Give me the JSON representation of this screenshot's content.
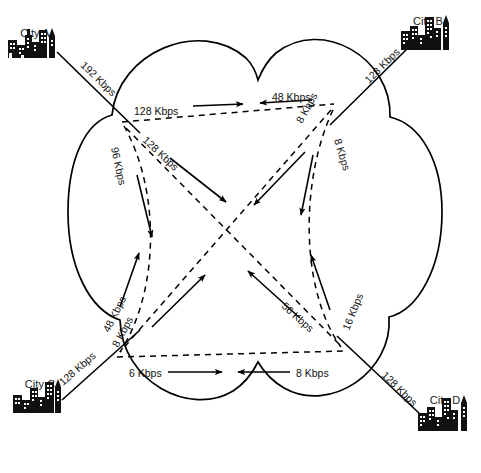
{
  "diagram": {
    "cloud_label": "wan-cloud",
    "line_color": "#000000"
  },
  "cities": [
    {
      "id": "city-a",
      "label": "City A",
      "position": "top-left",
      "access_link": "192 Kbps"
    },
    {
      "id": "city-b",
      "label": "City B",
      "position": "top-right",
      "access_link": "128 Kbps"
    },
    {
      "id": "city-c",
      "label": "City C",
      "position": "bottom-left",
      "access_link": "128 Kbps"
    },
    {
      "id": "city-d",
      "label": "City D",
      "position": "bottom-right",
      "access_link": "128 Kbps"
    }
  ],
  "access_links": [
    {
      "id": "access-a",
      "city": "City A",
      "rate": "192 Kbps"
    },
    {
      "id": "access-b",
      "city": "City B",
      "rate": "128 Kbps"
    },
    {
      "id": "access-c",
      "city": "City C",
      "rate": "128 Kbps"
    },
    {
      "id": "access-d",
      "city": "City D",
      "rate": "128 Kbps"
    }
  ],
  "pvc_links": [
    {
      "id": "pvc-top-ab",
      "from": "A",
      "to": "B",
      "rate": "128 Kbps",
      "direction": "right"
    },
    {
      "id": "pvc-top-ba",
      "from": "B",
      "to": "A",
      "rate": "48 Kbps",
      "direction": "left"
    },
    {
      "id": "pvc-left-ac",
      "from": "A",
      "to": "C",
      "rate": "96 Kbps",
      "direction": "down"
    },
    {
      "id": "pvc-left-ca",
      "from": "C",
      "to": "A",
      "rate": "48 Kbps",
      "direction": "up"
    },
    {
      "id": "pvc-diag-ad",
      "from": "A",
      "to": "D",
      "rate": "128 Kbps",
      "direction": "down-right"
    },
    {
      "id": "pvc-diag-da",
      "from": "D",
      "to": "A",
      "rate": "56 Kbps",
      "direction": "up-left"
    },
    {
      "id": "pvc-diag-bc",
      "from": "B",
      "to": "C",
      "rate": "8 Kbps",
      "direction": "down-left"
    },
    {
      "id": "pvc-diag-cb",
      "from": "C",
      "to": "B",
      "rate": "8 Kbps",
      "direction": "up-right"
    },
    {
      "id": "pvc-right-bd",
      "from": "B",
      "to": "D",
      "rate": "8 Kbps",
      "direction": "down"
    },
    {
      "id": "pvc-right-db",
      "from": "D",
      "to": "B",
      "rate": "16 Kbps",
      "direction": "up"
    },
    {
      "id": "pvc-bottom-cd",
      "from": "C",
      "to": "D",
      "rate": "6 Kbps",
      "direction": "right"
    },
    {
      "id": "pvc-bottom-dc",
      "from": "D",
      "to": "C",
      "rate": "8 Kbps",
      "direction": "left"
    }
  ],
  "labels": {
    "access_a": "192 Kbps",
    "access_b": "128 Kbps",
    "access_c": "128 Kbps",
    "access_d": "128 Kbps",
    "top_fwd": "128 Kbps",
    "top_rev": "48 Kbps",
    "left_down": "96 Kbps",
    "left_up": "48 Kbps",
    "diag_ad": "128 Kbps",
    "diag_da": "56 Kbps",
    "diag_bc": "8 Kbps",
    "diag_cb": "8 Kbps",
    "right_down": "8 Kbps",
    "right_up": "16 Kbps",
    "bottom_fwd": "6 Kbps",
    "bottom_rev": "8 Kbps"
  }
}
